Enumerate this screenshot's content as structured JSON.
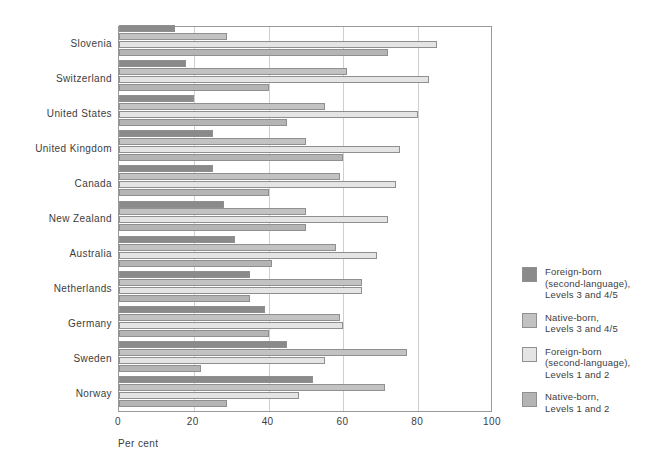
{
  "axis": {
    "x_title": "Per cent",
    "x_ticks": [
      "0",
      "20",
      "40",
      "60",
      "80",
      "100"
    ]
  },
  "legend": {
    "items": [
      {
        "label": "Foreign-born\n(second-language),\nLevels 3 and 4/5",
        "color": "#8a8a8a",
        "name": "foreign-born-levels-3-45"
      },
      {
        "label": "Native-born,\nLevels 3 and 4/5",
        "color": "#c2c2c2",
        "name": "native-born-levels-3-45"
      },
      {
        "label": "Foreign-born\n(second-language),\nLevels 1 and 2",
        "color": "#e4e4e4",
        "name": "foreign-born-levels-1-2"
      },
      {
        "label": "Native-born,\nLevels 1 and 2",
        "color": "#b4b4b4",
        "name": "native-born-levels-1-2"
      }
    ]
  },
  "chart_data": {
    "type": "bar",
    "orientation": "horizontal",
    "title": "",
    "xlabel": "Per cent",
    "ylabel": "",
    "xlim": [
      0,
      100
    ],
    "grid": true,
    "legend_position": "right",
    "categories": [
      "Slovenia",
      "Switzerland",
      "United States",
      "United Kingdom",
      "Canada",
      "New Zealand",
      "Australia",
      "Netherlands",
      "Germany",
      "Sweden",
      "Norway"
    ],
    "series": [
      {
        "name": "Foreign-born (second-language), Levels 3 and 4/5",
        "color": "#8a8a8a",
        "values": [
          15,
          18,
          20,
          25,
          25,
          28,
          31,
          35,
          39,
          45,
          52
        ]
      },
      {
        "name": "Native-born, Levels 3 and 4/5",
        "color": "#c2c2c2",
        "values": [
          29,
          61,
          55,
          50,
          59,
          50,
          58,
          65,
          59,
          77,
          71
        ]
      },
      {
        "name": "Foreign-born (second-language), Levels 1 and 2",
        "color": "#e4e4e4",
        "values": [
          85,
          83,
          80,
          75,
          74,
          72,
          69,
          65,
          60,
          55,
          48
        ]
      },
      {
        "name": "Native-born, Levels 1 and 2",
        "color": "#b4b4b4",
        "values": [
          72,
          40,
          45,
          60,
          40,
          50,
          41,
          35,
          40,
          22,
          29
        ]
      }
    ]
  }
}
